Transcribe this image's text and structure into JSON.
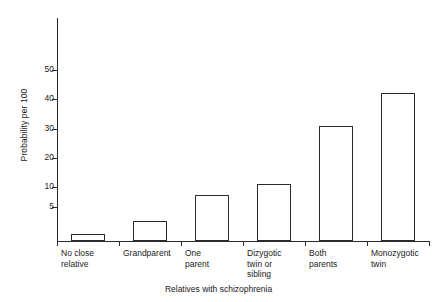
{
  "chart_data": {
    "type": "bar",
    "title": "",
    "xlabel": "Relatives with schizophrenia",
    "ylabel": "Probability per 100",
    "categories": [
      "No close\nrelative",
      "Grandparent",
      "One\nparent",
      "Dizygotic\ntwin or\nsibling",
      "Both\nparents",
      "Monozygotic\ntwin"
    ],
    "values": [
      1,
      3,
      8,
      11,
      31,
      42
    ],
    "ytick_labels": [
      "5",
      "10",
      "20",
      "30",
      "40",
      "50"
    ],
    "ytick_values": [
      5,
      10,
      20,
      30,
      40,
      50
    ],
    "ylim": [
      0,
      55
    ],
    "grid": false,
    "legend": null,
    "axis_note": "vertical scale compressed below 10",
    "colors": {
      "bar_fill": "#ffffff",
      "bar_edge": "#2b2b2b",
      "axis": "#2b2b2b",
      "text": "#1a1a1a",
      "background": "#ffffff"
    }
  }
}
